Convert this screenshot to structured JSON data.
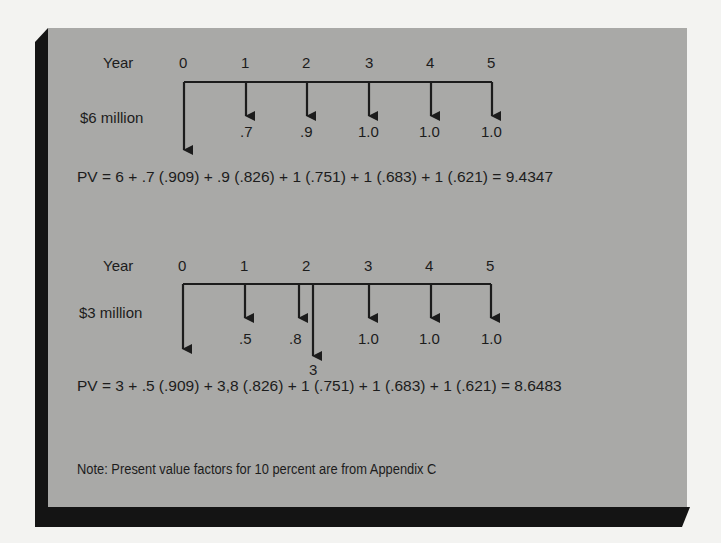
{
  "figure": {
    "panel_color": "#a9a9a7",
    "shadow_color": "#141414",
    "background_color": "#f3f3f1"
  },
  "diagram1": {
    "year_label": "Year",
    "years": [
      "0",
      "1",
      "2",
      "3",
      "4",
      "5"
    ],
    "investment_label": "$6 million",
    "cash_flows": [
      ".7",
      ".9",
      "1.0",
      "1.0",
      "1.0"
    ],
    "equation": "PV = 6 + .7 (.909) + .9 (.826) + 1 (.751) + 1 (.683) + 1 (.621) = 9.4347"
  },
  "diagram2": {
    "year_label": "Year",
    "years": [
      "0",
      "1",
      "2",
      "3",
      "4",
      "5"
    ],
    "investment_label": "$3 million",
    "cash_flows": [
      ".5",
      ".8",
      "1.0",
      "1.0",
      "1.0"
    ],
    "year2_additional_outlay": "3",
    "equation": "PV = 3 + .5 (.909) + 3,8 (.826) + 1 (.751) + 1 (.683) + 1 (.621) = 8.6483"
  },
  "note": "Note:  Present value factors for 10 percent are from Appendix C"
}
